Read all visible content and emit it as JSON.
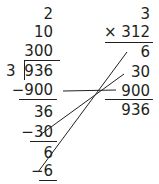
{
  "division": {
    "partial_quotients": [
      "2",
      "10",
      "300"
    ],
    "divisor": "3",
    "dividend": "936",
    "steps": [
      {
        "subtract": "−900",
        "remainder": "36"
      },
      {
        "subtract": "−30",
        "remainder": "6"
      },
      {
        "subtract": "−6"
      }
    ]
  },
  "multiplication": {
    "top": "3",
    "bottom": "× 312",
    "partial_products": [
      "6",
      "30",
      "900"
    ],
    "total": "936"
  },
  "connectors": [
    {
      "from": "−900",
      "to": "900"
    },
    {
      "from": "−30",
      "to": "30"
    },
    {
      "from": "−6",
      "to": "6"
    }
  ],
  "colors": {
    "ink": "#231f20",
    "background": "#ffffff"
  }
}
